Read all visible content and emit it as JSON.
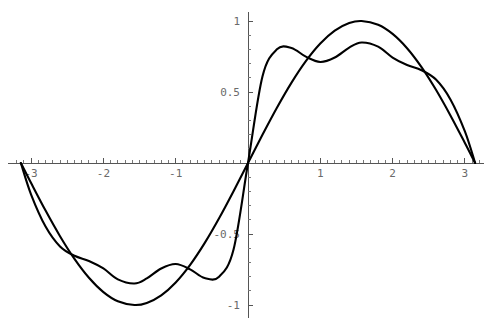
{
  "chart_data": {
    "type": "line",
    "title": "",
    "subtitle": "",
    "xlabel": "",
    "ylabel": "",
    "xlim": [
      -3.25,
      3.25
    ],
    "ylim": [
      -1.08,
      1.08
    ],
    "grid": false,
    "legend": "none",
    "background_color": "#ffffff",
    "curve_color": "#000000",
    "axis_color": "#555555",
    "label_color": "#6a6a6a",
    "x_ticks_major": [
      -3,
      -2,
      -1,
      1,
      2,
      3
    ],
    "x_tick_labels": [
      "-3",
      "-2",
      "-1",
      "1",
      "2",
      "3"
    ],
    "y_ticks_major": [
      -1,
      -0.5,
      0.5,
      1
    ],
    "y_tick_labels": [
      "-1",
      "-0.5",
      "0.5",
      "1"
    ],
    "x_minor_step": 0.1,
    "y_minor_step": 0.1,
    "series": [
      {
        "name": "sin(x)",
        "peak": 1.0,
        "trough": -1.0,
        "peak_x": 1.5708,
        "trough_x": -1.5708,
        "zero_crossings": [
          -3.1416,
          0,
          3.1416
        ],
        "x": [
          -3.1416,
          -3.0,
          -2.8,
          -2.6,
          -2.4,
          -2.2,
          -2.0,
          -1.8,
          -1.5708,
          -1.4,
          -1.2,
          -1.0,
          -0.8,
          -0.6,
          -0.4,
          -0.2,
          0.0,
          0.2,
          0.4,
          0.6,
          0.8,
          1.0,
          1.2,
          1.4,
          1.5708,
          1.8,
          2.0,
          2.2,
          2.4,
          2.6,
          2.8,
          3.0,
          3.1416
        ],
        "values": [
          0.0,
          -0.1411,
          -0.335,
          -0.5155,
          -0.6755,
          -0.8085,
          -0.9093,
          -0.9738,
          -1.0,
          -0.9854,
          -0.932,
          -0.8415,
          -0.7174,
          -0.5646,
          -0.3894,
          -0.1987,
          0.0,
          0.1987,
          0.3894,
          0.5646,
          0.7174,
          0.8415,
          0.932,
          0.9854,
          1.0,
          0.9738,
          0.9093,
          0.8085,
          0.6755,
          0.5155,
          0.335,
          0.1411,
          0.0
        ]
      },
      {
        "name": "sin(x) + sin(3x)/3",
        "peak": 0.8488,
        "trough": -0.8488,
        "peak_x": 1.5708,
        "trough_x": -1.5708,
        "zero_crossings": [
          -3.1416,
          0,
          3.1416
        ],
        "x": [
          -3.1416,
          -3.0,
          -2.8,
          -2.6,
          -2.4,
          -2.2,
          -2.0,
          -1.8,
          -1.5708,
          -1.4,
          -1.2,
          -1.0,
          -0.8,
          -0.6,
          -0.4,
          -0.2,
          0.0,
          0.2,
          0.4,
          0.6,
          0.8,
          1.0,
          1.2,
          1.4,
          1.5708,
          1.8,
          2.0,
          2.2,
          2.4,
          2.6,
          2.8,
          3.0,
          3.1416
        ],
        "values": [
          0.0,
          -0.2224,
          -0.4476,
          -0.5876,
          -0.6536,
          -0.6898,
          -0.7427,
          -0.8197,
          -0.8488,
          -0.8127,
          -0.7426,
          -0.7115,
          -0.7488,
          -0.8105,
          -0.8007,
          -0.6094,
          0.0,
          0.6094,
          0.8007,
          0.8105,
          0.7488,
          0.7115,
          0.7426,
          0.8127,
          0.8488,
          0.8197,
          0.7427,
          0.6898,
          0.6536,
          0.5876,
          0.4476,
          0.2224,
          0.0
        ]
      }
    ],
    "annotations": []
  },
  "geometry": {
    "origin_x_px": 248,
    "origin_y_px": 163,
    "x_scale_px_per_unit": 72.3,
    "y_scale_px_per_unit": 142,
    "x_axis_left_px": 8,
    "x_axis_right_px": 484,
    "y_axis_top_px": 12,
    "y_axis_bottom_px": 318,
    "tick_major_len": 5,
    "tick_minor_len": 3
  }
}
